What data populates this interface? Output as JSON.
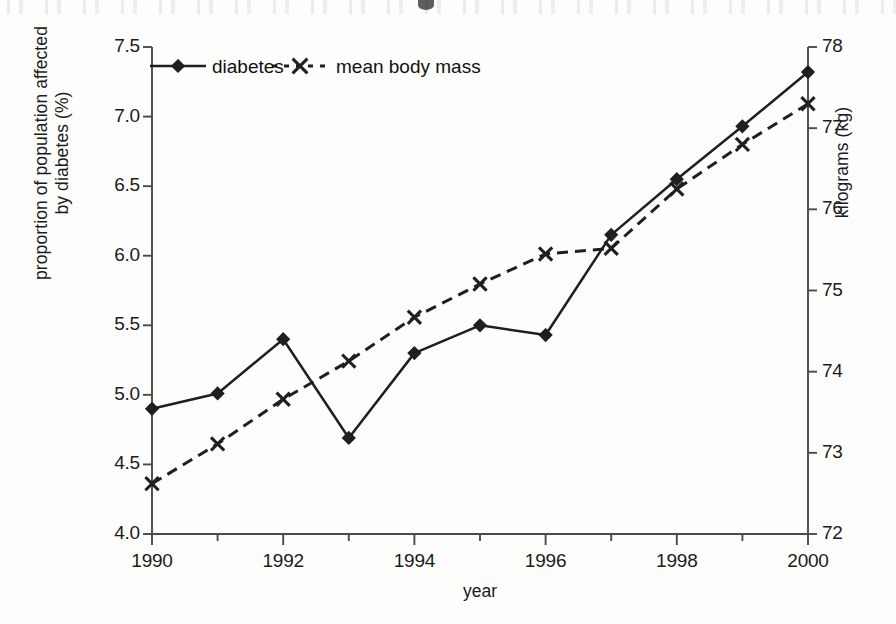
{
  "chart_data": {
    "type": "line",
    "title": "",
    "xlabel": "year",
    "ylabel": "proportion of population affected by diabetes (%)",
    "ylabel_line1": "proportion of population affected",
    "ylabel_line2": "by diabetes (%)",
    "ylabel_secondary": "kilograms (kg)",
    "x": [
      1990,
      1991,
      1992,
      1993,
      1994,
      1995,
      1996,
      1997,
      1998,
      1999,
      2000
    ],
    "xtick_labels": [
      "1990",
      "1992",
      "1994",
      "1996",
      "1998",
      "2000"
    ],
    "xtick_values": [
      1990,
      1992,
      1994,
      1996,
      1998,
      2000
    ],
    "xminor_values": [
      1991,
      1993,
      1995,
      1997,
      1999
    ],
    "xlim": [
      1990,
      2000
    ],
    "ylim": [
      4.0,
      7.5
    ],
    "ytick_labels": [
      "4.0",
      "4.5",
      "5.0",
      "5.5",
      "6.0",
      "6.5",
      "7.0",
      "7.5"
    ],
    "ytick_values": [
      4.0,
      4.5,
      5.0,
      5.5,
      6.0,
      6.5,
      7.0,
      7.5
    ],
    "ylim_secondary": [
      72,
      78
    ],
    "ytick_labels_secondary": [
      "72",
      "73",
      "74",
      "75",
      "76",
      "77",
      "78"
    ],
    "ytick_values_secondary": [
      72,
      73,
      74,
      75,
      76,
      77,
      78
    ],
    "grid": false,
    "legend_position": "top-left inside",
    "series": [
      {
        "name": "diabetes",
        "axis": "left",
        "unit": "%",
        "linestyle": "solid",
        "marker": "diamond",
        "color": "#1f1f1f",
        "values": [
          4.9,
          5.01,
          5.4,
          4.69,
          5.3,
          5.5,
          5.43,
          6.15,
          6.55,
          6.93,
          7.32
        ]
      },
      {
        "name": "mean body mass",
        "axis": "right",
        "unit": "kg",
        "linestyle": "dashed",
        "marker": "x",
        "color": "#1f1f1f",
        "values": [
          72.62,
          73.11,
          73.66,
          74.13,
          74.67,
          75.08,
          75.45,
          75.52,
          76.25,
          76.8,
          77.3
        ]
      }
    ]
  },
  "legend": {
    "items": [
      {
        "label": "diabetes",
        "marker": "diamond",
        "linestyle": "solid"
      },
      {
        "label": "mean body mass",
        "marker": "x",
        "linestyle": "dashed"
      }
    ]
  },
  "colors": {
    "ink": "#1f1f1f",
    "axis": "#4a4a4a",
    "page": "#fdfdfb"
  }
}
